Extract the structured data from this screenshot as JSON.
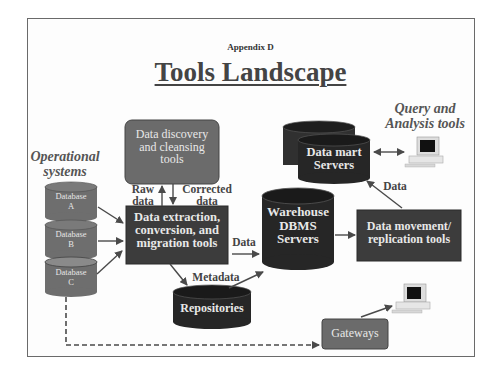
{
  "header": {
    "appendix": "Appendix D",
    "title": "Tools Landscape"
  },
  "labels": {
    "operational_systems": "Operational systems",
    "query_analysis": "Query and Analysis tools",
    "raw_data": "Raw data",
    "corrected_data": "Corrected data",
    "data_to_warehouse": "Data",
    "metadata": "Metadata",
    "data_to_mart": "Data"
  },
  "nodes": {
    "discovery": "Data discovery and cleansing tools",
    "extraction": "Data extraction, conversion, and migration tools",
    "warehouse": "Warehouse DBMS Servers",
    "datamart": "Data mart Servers",
    "movement": "Data movement/ replication tools",
    "repositories": "Repositories",
    "gateways": "Gateways",
    "databases": [
      {
        "name": "Database",
        "id": "A"
      },
      {
        "name": "Database",
        "id": "B"
      },
      {
        "name": "Database",
        "id": "C"
      }
    ]
  },
  "colors": {
    "dark_box": "#3c3c3c",
    "mid_box": "#6b6b6b",
    "cylinder": "#2a2a2a",
    "db_cylinder": "#6e6e6e",
    "arrow": "#4a4a4a"
  }
}
